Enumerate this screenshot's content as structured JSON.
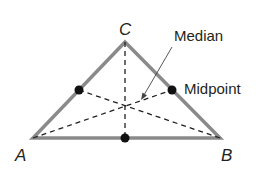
{
  "figure": {
    "colors": {
      "triangle_stroke": "#8a8a8a",
      "median_stroke": "#231f20",
      "point_fill": "#111111",
      "text": "#231f20"
    },
    "vertices": {
      "A": {
        "label": "A",
        "x": 33,
        "y": 138
      },
      "B": {
        "label": "B",
        "x": 220,
        "y": 138
      },
      "C": {
        "label": "C",
        "x": 125,
        "y": 42
      }
    },
    "midpoints": [
      {
        "name": "midpoint-AC",
        "x": 79,
        "y": 90
      },
      {
        "name": "midpoint-BC",
        "x": 172,
        "y": 90
      },
      {
        "name": "midpoint-AB",
        "x": 125,
        "y": 138
      }
    ],
    "centroid": {
      "x": 125,
      "y": 106
    },
    "annotations": {
      "median_label": "Median",
      "midpoint_label": "Midpoint"
    }
  }
}
